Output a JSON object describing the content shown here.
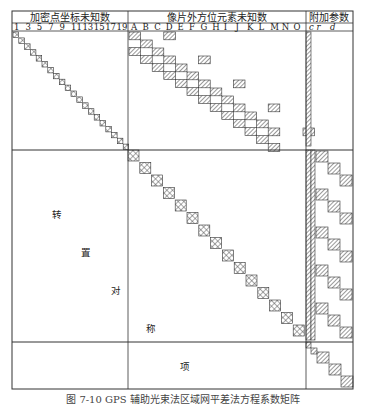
{
  "headers": {
    "section1": "加密点坐标未知数",
    "section2": "像片外方位元素未知数",
    "section3": "附加参数"
  },
  "section1_columns": [
    "1",
    "3",
    "5",
    "7",
    "9",
    "11",
    "13",
    "15",
    "17",
    "19"
  ],
  "section2_columns": [
    "A",
    "B",
    "C",
    "D",
    "E",
    "F",
    "G",
    "H",
    "I",
    "J",
    "K",
    "L",
    "M",
    "N",
    "O"
  ],
  "section3_columns": [
    "c r",
    "d"
  ],
  "body_labels": [
    "转",
    "置",
    "对",
    "称",
    "项"
  ],
  "caption": "图 7-10  GPS 辅助光束法区域网平差法方程系数矩阵",
  "colors": {
    "line": "#333333",
    "hatch": "#555555",
    "background": "#ffffff"
  }
}
